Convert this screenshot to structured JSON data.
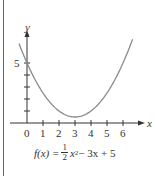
{
  "chart_data": {
    "type": "line",
    "title": "",
    "function": "f(x) = 1/2 x^2 - 3x + 5",
    "xlabel": "x",
    "ylabel": "y",
    "x_ticks": [
      0,
      1,
      2,
      3,
      4,
      5,
      6
    ],
    "y_ticks_labeled": [
      5
    ],
    "y_ticks": [
      1,
      2,
      3,
      4,
      5
    ],
    "xlim": [
      -0.6,
      6.9
    ],
    "ylim": [
      0,
      6.8
    ],
    "vertex": [
      3,
      0.5
    ],
    "y_intercept": [
      0,
      5
    ],
    "series": [
      {
        "name": "f(x)",
        "x": [
          -0.5,
          0,
          1,
          2,
          3,
          4,
          5,
          6,
          6.6
        ],
        "values": [
          6.625,
          5,
          2.5,
          1,
          0.5,
          1,
          2.5,
          5,
          6.98
        ]
      }
    ],
    "grid": false,
    "curve_color": "#8a8a8a",
    "axis_color": "#333333"
  },
  "labels": {
    "x_axis": "x",
    "y_axis": "y",
    "y_five": "5",
    "ticks": [
      "0",
      "1",
      "2",
      "3",
      "4",
      "5",
      "6"
    ]
  },
  "formula": {
    "lhs": "f(x) = ",
    "frac_num": "1",
    "frac_den": "2",
    "term1": "x",
    "exp": "2",
    "rest": " − 3x + 5"
  }
}
